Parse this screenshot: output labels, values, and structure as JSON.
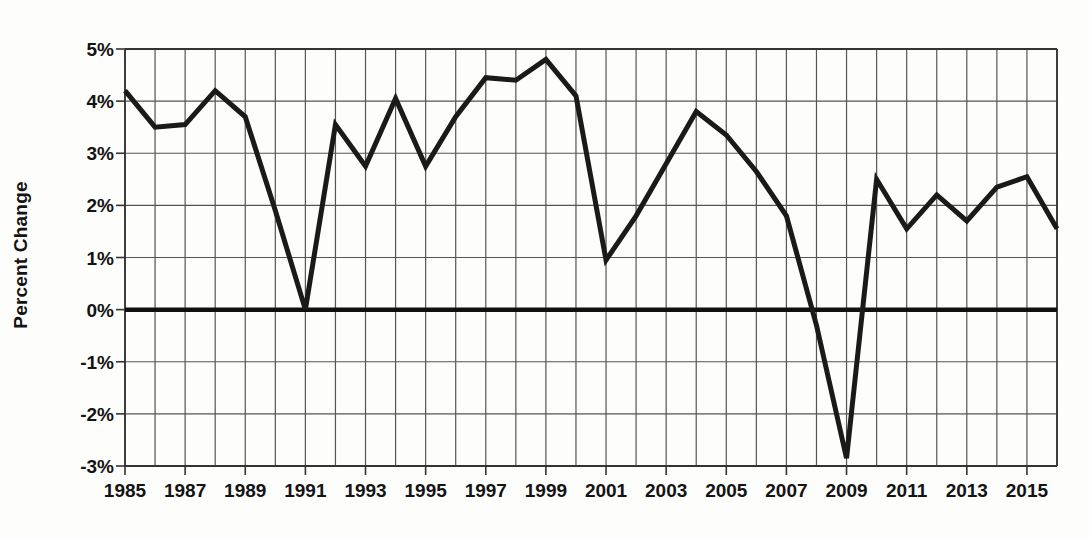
{
  "chart_data": {
    "type": "line",
    "title": "",
    "subtitle": "",
    "xlabel": "",
    "ylabel": "Percent Change",
    "xlim": [
      1985,
      2016
    ],
    "ylim": [
      -3,
      5
    ],
    "grid": true,
    "legend": false,
    "y_tick_labels": [
      "5%",
      "4%",
      "3%",
      "2%",
      "1%",
      "0%",
      "-1%",
      "-2%",
      "-3%"
    ],
    "y_tick_values": [
      5,
      4,
      3,
      2,
      1,
      0,
      -1,
      -2,
      -3
    ],
    "x_tick_labels": [
      "1985",
      "1987",
      "1989",
      "1991",
      "1993",
      "1995",
      "1997",
      "1999",
      "2001",
      "2003",
      "2005",
      "2007",
      "2009",
      "2011",
      "2013",
      "2015"
    ],
    "x_tick_values": [
      1985,
      1987,
      1989,
      1991,
      1993,
      1995,
      1997,
      1999,
      2001,
      2003,
      2005,
      2007,
      2009,
      2011,
      2013,
      2015
    ],
    "x": [
      1985,
      1986,
      1987,
      1988,
      1989,
      1990,
      1991,
      1992,
      1993,
      1994,
      1995,
      1996,
      1997,
      1998,
      1999,
      2000,
      2001,
      2002,
      2003,
      2004,
      2005,
      2006,
      2007,
      2008,
      2009,
      2010,
      2011,
      2012,
      2013,
      2014,
      2015,
      2016
    ],
    "values": [
      4.2,
      3.5,
      3.55,
      4.2,
      3.7,
      1.9,
      0.0,
      3.55,
      2.75,
      4.05,
      2.75,
      3.7,
      4.45,
      4.4,
      4.8,
      4.1,
      0.95,
      1.8,
      2.8,
      3.8,
      3.35,
      2.65,
      1.8,
      -0.3,
      -2.85,
      2.5,
      1.55,
      2.2,
      1.7,
      2.35,
      2.55,
      1.55
    ],
    "series_name": "Percent Change",
    "line_color": "#1a1a1a",
    "line_width": 5,
    "grid_color": "#555555",
    "zero_line_color": "#111111",
    "background_color": "#ffffff"
  },
  "axes": {
    "y_title": "Percent Change"
  }
}
